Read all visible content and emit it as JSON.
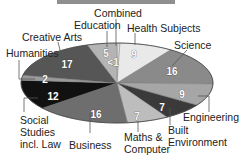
{
  "chart_data": {
    "type": "pie",
    "title": "",
    "style": "3d-ellipse",
    "center": [
      117,
      83
    ],
    "radii": [
      96,
      40
    ],
    "start_angle_deg": -90,
    "direction": "clockwise",
    "slices": [
      {
        "name": "Combined",
        "value": 0.5,
        "label": "<1",
        "color": "#dcdcdc"
      },
      {
        "name": "Health Subjects",
        "value": 9,
        "label": "9",
        "color": "#e9e9e9"
      },
      {
        "name": "Science",
        "value": 16,
        "label": "16",
        "color": "#8a8a8a"
      },
      {
        "name": "Engineering",
        "value": 9,
        "label": "9",
        "color": "#a6a6a6"
      },
      {
        "name": "Built Environment",
        "value": 7,
        "label": "7",
        "color": "#3a3a3a"
      },
      {
        "name": "Maths & Computer",
        "value": 7,
        "label": "7",
        "color": "#bdbdbd"
      },
      {
        "name": "Business",
        "value": 16,
        "label": "16",
        "color": "#6e6e6e"
      },
      {
        "name": "Social Studies incl. Law",
        "value": 12,
        "label": "12",
        "color": "#111111"
      },
      {
        "name": "Humanities",
        "value": 2,
        "label": "2",
        "color": "#9b9b9b"
      },
      {
        "name": "Creative Arts",
        "value": 17,
        "label": "17",
        "color": "#565656"
      },
      {
        "name": "Education",
        "value": 5,
        "label": "5",
        "color": "#b4b4b4"
      }
    ],
    "legend": "none (callout labels)"
  },
  "labels": {
    "combined": "Combined",
    "health": "Health Subjects",
    "science": "Science",
    "engineering": "Engineering",
    "built_1": "Built",
    "built_2": "Environment",
    "maths_1": "Maths &",
    "maths_2": "Computer",
    "business": "Business",
    "social_1": "Social",
    "social_2": "Studies",
    "social_3": "incl. Law",
    "humanities": "Humanities",
    "creative": "Creative Arts",
    "education": "Education"
  },
  "values": {
    "combined": "<1",
    "health": "9",
    "science": "16",
    "engineering": "9",
    "built": "7",
    "maths": "7",
    "business": "16",
    "social": "12",
    "humanities": "2",
    "creative": "17",
    "education": "5"
  }
}
